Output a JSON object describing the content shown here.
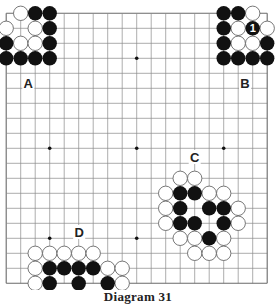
{
  "title": "Diagram 31",
  "board": {
    "size": 19,
    "origin_x": 6.2,
    "origin_y": 13.3,
    "step_x": 14.5,
    "step_y": 15,
    "stone_radius": 7.2,
    "line_color": "#8a8a8a",
    "edge_color": "#6a6a6a",
    "black_color": "#111111",
    "white_fill": "#ffffff",
    "white_stroke": "#555555",
    "star_points": [
      [
        3,
        3
      ],
      [
        9,
        3
      ],
      [
        15,
        3
      ],
      [
        3,
        9
      ],
      [
        9,
        9
      ],
      [
        15,
        9
      ],
      [
        3,
        15
      ],
      [
        9,
        15
      ],
      [
        15,
        15
      ]
    ]
  },
  "stones": {
    "black": [
      [
        2,
        0
      ],
      [
        3,
        0
      ],
      [
        3,
        1
      ],
      [
        0,
        2
      ],
      [
        3,
        2
      ],
      [
        0,
        3
      ],
      [
        1,
        3
      ],
      [
        2,
        3
      ],
      [
        3,
        3
      ],
      [
        15,
        0
      ],
      [
        16,
        0
      ],
      [
        15,
        1
      ],
      [
        17,
        1
      ],
      [
        15,
        2
      ],
      [
        18,
        2
      ],
      [
        15,
        3
      ],
      [
        16,
        3
      ],
      [
        17,
        3
      ],
      [
        18,
        3
      ],
      [
        12,
        12
      ],
      [
        13,
        12
      ],
      [
        12,
        13
      ],
      [
        14,
        13
      ],
      [
        15,
        13
      ],
      [
        12,
        14
      ],
      [
        13,
        14
      ],
      [
        15,
        14
      ],
      [
        14,
        15
      ],
      [
        3,
        17
      ],
      [
        4,
        17
      ],
      [
        5,
        17
      ],
      [
        6,
        17
      ],
      [
        3,
        18
      ],
      [
        5,
        18
      ],
      [
        7,
        18
      ]
    ],
    "white": [
      [
        1,
        0
      ],
      [
        0,
        1
      ],
      [
        2,
        1
      ],
      [
        1,
        2
      ],
      [
        2,
        2
      ],
      [
        17,
        0
      ],
      [
        16,
        1
      ],
      [
        18,
        1
      ],
      [
        16,
        2
      ],
      [
        17,
        2
      ],
      [
        12,
        11
      ],
      [
        13,
        11
      ],
      [
        11,
        12
      ],
      [
        14,
        12
      ],
      [
        15,
        12
      ],
      [
        11,
        13
      ],
      [
        16,
        13
      ],
      [
        11,
        14
      ],
      [
        16,
        14
      ],
      [
        12,
        15
      ],
      [
        13,
        15
      ],
      [
        15,
        15
      ],
      [
        13,
        16
      ],
      [
        14,
        16
      ],
      [
        15,
        16
      ],
      [
        2,
        16
      ],
      [
        3,
        16
      ],
      [
        4,
        16
      ],
      [
        5,
        16
      ],
      [
        6,
        16
      ],
      [
        2,
        17
      ],
      [
        7,
        17
      ],
      [
        8,
        17
      ],
      [
        2,
        18
      ],
      [
        8,
        18
      ]
    ]
  },
  "move_labels": [
    {
      "col": 17,
      "row": 1,
      "text": "1",
      "on": "black"
    }
  ],
  "region_labels": [
    {
      "text": "A",
      "x": 28.3,
      "y": 82.5
    },
    {
      "text": "B",
      "x": 245,
      "y": 82.5
    },
    {
      "text": "C",
      "x": 194.7,
      "y": 157
    },
    {
      "text": "D",
      "x": 79.2,
      "y": 232
    }
  ]
}
